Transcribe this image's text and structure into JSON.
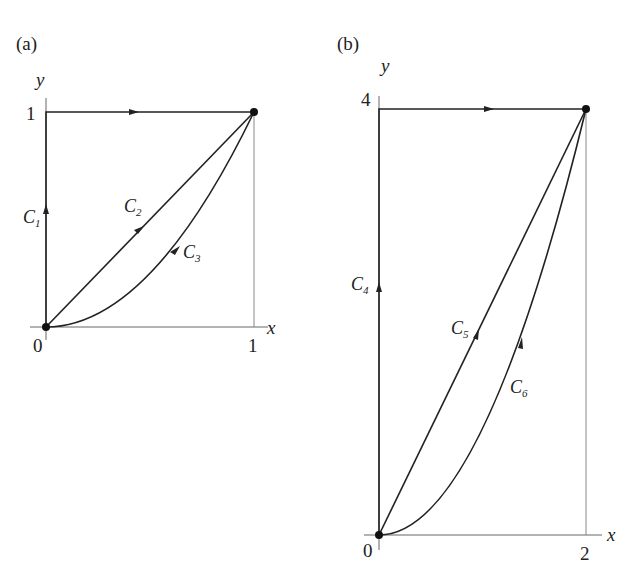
{
  "figure": {
    "panels": [
      {
        "id": "a",
        "label": "(a)",
        "axes": {
          "x_var": "x",
          "y_var": "y",
          "x_tick": "1",
          "y_tick": "1",
          "origin_label": "0"
        },
        "endpoint": [
          1,
          1
        ],
        "curves": [
          {
            "name": "C",
            "sub": "1",
            "description": "from (0,0) up y-axis to (0,1), then right along y=1 to (1,1)"
          },
          {
            "name": "C",
            "sub": "2",
            "description": "straight line y = x from (0,0) to (1,1)"
          },
          {
            "name": "C",
            "sub": "3",
            "description": "parabola y = x^2 from (0,0) to (1,1)"
          }
        ]
      },
      {
        "id": "b",
        "label": "(b)",
        "axes": {
          "x_var": "x",
          "y_var": "y",
          "x_tick": "2",
          "y_tick": "4",
          "origin_label": "0"
        },
        "endpoint": [
          2,
          4
        ],
        "curves": [
          {
            "name": "C",
            "sub": "4",
            "description": "from (0,0) up y-axis to (0,4), then right along y=4 to (2,4)"
          },
          {
            "name": "C",
            "sub": "5",
            "description": "straight line y = 2x from (0,0) to (2,4)"
          },
          {
            "name": "C",
            "sub": "6",
            "description": "parabola y = x^2 from (0,0) to (2,4)"
          }
        ]
      }
    ]
  }
}
